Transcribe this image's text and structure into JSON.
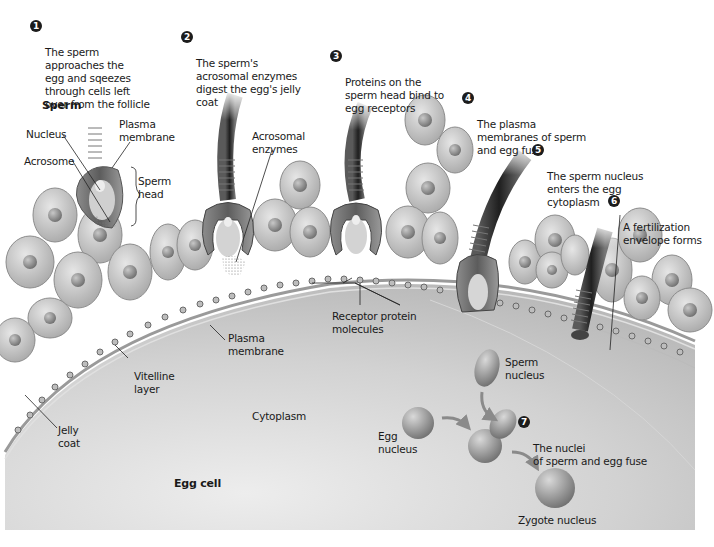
{
  "figure": {
    "steps": [
      {
        "number": "1",
        "text": "The sperm\napproaches the\negg and sqeezes\nthrough cells left\nover from the follicle"
      },
      {
        "number": "2",
        "text": "The sperm's\nacrosomal enzymes\ndigest the egg's jelly\ncoat"
      },
      {
        "number": "3",
        "text": "Proteins on the\nsperm head bind to\negg receptors"
      },
      {
        "number": "4",
        "text": "The plasma\nmembranes of sperm\nand egg fuse"
      },
      {
        "number": "5",
        "text": "The sperm nucleus\nenters the egg\ncytoplasm"
      },
      {
        "number": "6",
        "text": "A fertilization\nenvelope forms"
      },
      {
        "number": "7",
        "text": "The nuclei\nof sperm and egg fuse"
      }
    ],
    "labels": {
      "sperm": "Sperm",
      "nucleus": "Nucleus",
      "acrosome": "Acrosome",
      "sperm_plasma_membrane": "Plasma\nmembrane",
      "sperm_head": "Sperm\nhead",
      "acrosomal_enzymes": "Acrosomal\nenzymes",
      "receptor_protein": "Receptor protein\nmolecules",
      "egg_plasma_membrane": "Plasma\nmembrane",
      "vitelline_layer": "Vitelline\nlayer",
      "jelly_coat": "Jelly\ncoat",
      "cytoplasm": "Cytoplasm",
      "egg_cell": "Egg cell",
      "sperm_nucleus": "Sperm\nnucleus",
      "egg_nucleus": "Egg\nnucleus",
      "zygote_nucleus": "Zygote nucleus"
    },
    "colors": {
      "egg_cytoplasm": "#c9c9c9",
      "follicle_cell": "#c4c4c4",
      "follicle_nucleus": "#8a8a8a",
      "sperm_tail_dark": "#3a3a3a",
      "sperm_midpiece": "#9e9e9e",
      "badge": "#1c1c1c"
    }
  }
}
